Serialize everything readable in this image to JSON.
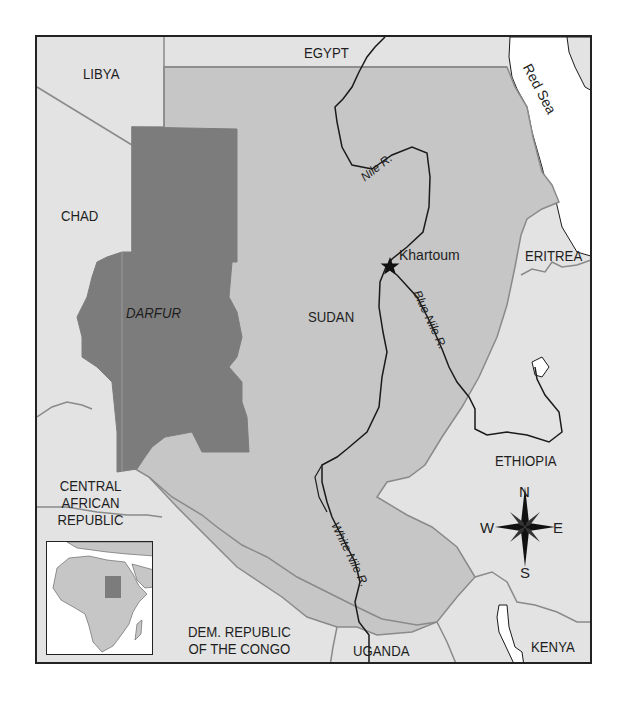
{
  "map": {
    "title_region": "Darfur, Sudan",
    "countries": {
      "libya": "LIBYA",
      "egypt": "EGYPT",
      "chad": "CHAD",
      "sudan": "SUDAN",
      "eritrea": "ERITREA",
      "ethiopia": "ETHIOPIA",
      "car_line1": "CENTRAL",
      "car_line2": "AFRICAN",
      "car_line3": "REPUBLIC",
      "drc_line1": "DEM. REPUBLIC",
      "drc_line2": "OF THE CONGO",
      "uganda": "UGANDA",
      "kenya": "KENYA"
    },
    "region": {
      "darfur": "DARFUR"
    },
    "water": {
      "red_sea": "Red Sea"
    },
    "rivers": {
      "nile": "Nile R.",
      "blue_nile": "Blue Nile R.",
      "white_nile": "White Nile R."
    },
    "cities": {
      "capital": "Khartoum"
    },
    "compass": {
      "n": "N",
      "s": "S",
      "e": "E",
      "w": "W"
    },
    "colors": {
      "neighbors": "#e3e3e3",
      "sudan": "#c6c6c6",
      "darfur": "#7c7c7c",
      "water": "#ffffff",
      "border": "#8a8a8a",
      "river": "#1a1a1a",
      "frame": "#222222"
    },
    "inset": {
      "label": "Africa locator inset"
    }
  }
}
